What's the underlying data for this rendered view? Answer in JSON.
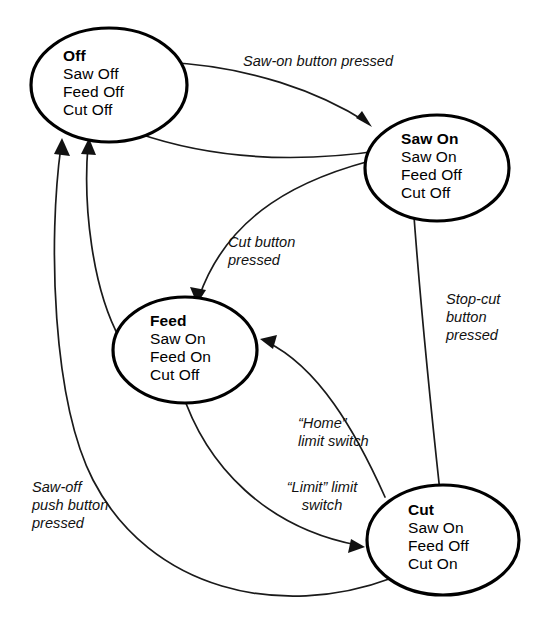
{
  "diagram": {
    "type": "state-transition-diagram",
    "states": [
      {
        "id": "off",
        "name": "Off",
        "outputs": [
          "Saw Off",
          "Feed Off",
          "Cut Off"
        ]
      },
      {
        "id": "saw-on",
        "name": "Saw On",
        "outputs": [
          "Saw On",
          "Feed Off",
          "Cut Off"
        ]
      },
      {
        "id": "feed",
        "name": "Feed",
        "outputs": [
          "Saw On",
          "Feed On",
          "Cut Off"
        ]
      },
      {
        "id": "cut",
        "name": "Cut",
        "outputs": [
          "Saw On",
          "Feed Off",
          "Cut On"
        ]
      }
    ],
    "transitions": [
      {
        "id": "off-to-sawon",
        "from": "off",
        "to": "saw-on",
        "label_lines": [
          "Saw-on button pressed"
        ]
      },
      {
        "id": "sawon-to-off",
        "from": "saw-on",
        "to": "off",
        "label_lines": []
      },
      {
        "id": "sawon-to-feed",
        "from": "saw-on",
        "to": "feed",
        "label_lines": [
          "Cut button",
          "pressed"
        ]
      },
      {
        "id": "feed-to-off",
        "from": "feed",
        "to": "off",
        "label_lines": []
      },
      {
        "id": "feed-to-cut",
        "from": "feed",
        "to": "cut",
        "label_lines": [
          "“Limit” limit",
          "switch"
        ]
      },
      {
        "id": "cut-to-feed",
        "from": "cut",
        "to": "feed",
        "label_lines": [
          "“Home”",
          "limit switch"
        ]
      },
      {
        "id": "cut-to-sawon",
        "from": "cut",
        "to": "saw-on",
        "label_lines": [
          "Stop-cut",
          "button",
          "pressed"
        ]
      },
      {
        "id": "cut-to-off",
        "from": "cut",
        "to": "off",
        "label_lines": [
          "Saw-off",
          "push button",
          "pressed"
        ]
      }
    ],
    "labels": {
      "saw_on_pressed": "Saw-on button pressed",
      "cut_pressed_l1": "Cut button",
      "cut_pressed_l2": "pressed",
      "stop_cut_l1": "Stop-cut",
      "stop_cut_l2": "button",
      "stop_cut_l3": "pressed",
      "home_l1": "“Home”",
      "home_l2": "limit switch",
      "limit_l1": "“Limit” limit",
      "limit_l2": "switch",
      "saw_off_l1": "Saw-off",
      "saw_off_l2": "push button",
      "saw_off_l3": "pressed"
    },
    "colors": {
      "stroke": "#000000",
      "background": "#ffffff",
      "edge": "#1a1a1a"
    }
  }
}
